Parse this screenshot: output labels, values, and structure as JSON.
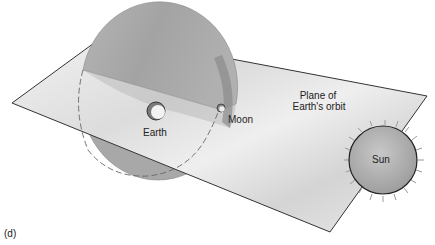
{
  "figure": {
    "panel_label": "(d)",
    "labels": {
      "earth": "Earth",
      "moon": "Moon",
      "plane_line1": "Plane of",
      "plane_line2": "Earth's orbit",
      "sun": "Sun"
    },
    "colors": {
      "plane_fill": "#e6e6e6",
      "disk_fill": "#a9a9a9",
      "sun_fill": "#b4b4b4",
      "outline": "#333333"
    }
  }
}
